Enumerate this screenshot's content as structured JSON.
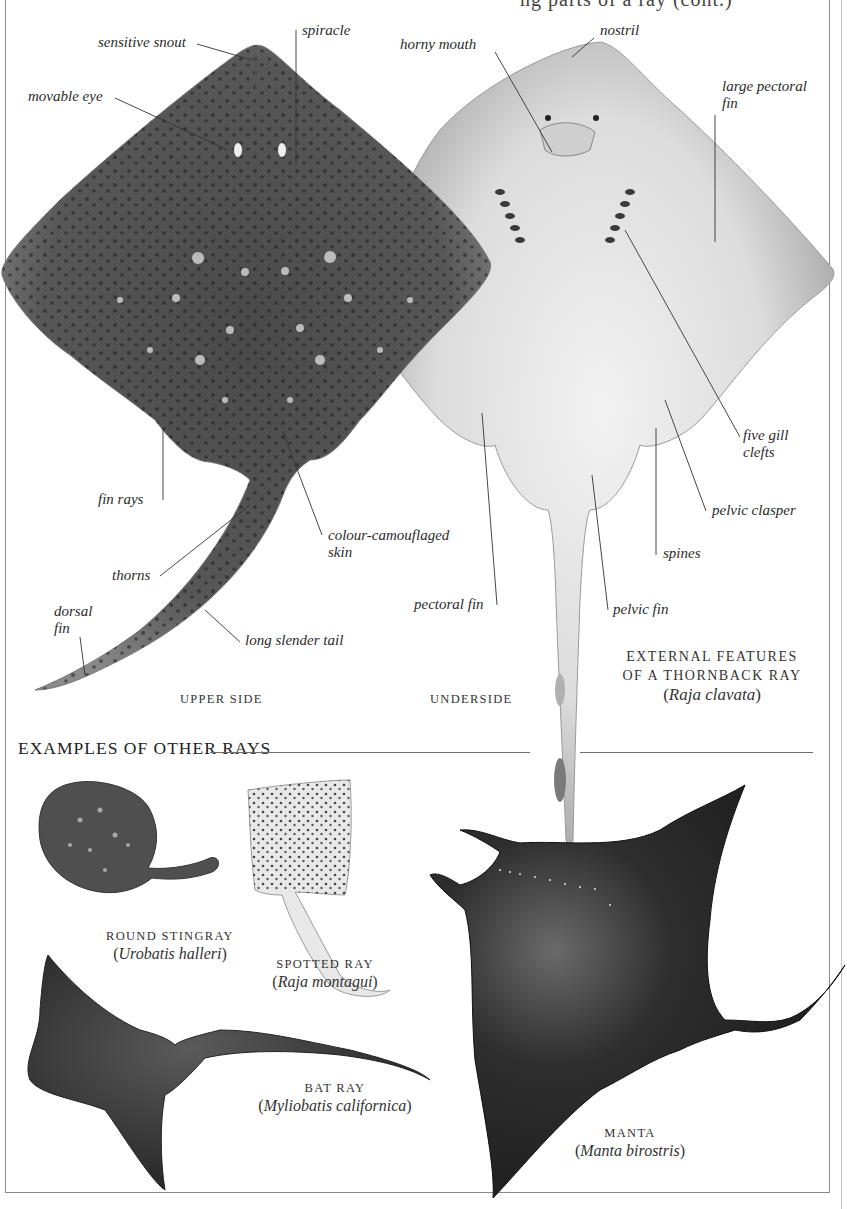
{
  "page": {
    "header_fragment": "ng parts of a ray (cont.)",
    "main_caption": {
      "line1": "EXTERNAL FEATURES",
      "line2": "OF A THORNBACK RAY",
      "sci_name": "Raja clavata"
    },
    "views": {
      "upper": "UPPER SIDE",
      "under": "UNDERSIDE"
    },
    "labels_upper": {
      "sensitive_snout": "sensitive snout",
      "spiracle": "spiracle",
      "movable_eye": "movable eye",
      "fin_rays": "fin rays",
      "colour_skin_1": "colour-camouflaged",
      "colour_skin_2": "skin",
      "thorns": "thorns",
      "dorsal_fin_1": "dorsal",
      "dorsal_fin_2": "fin",
      "long_tail": "long slender tail"
    },
    "labels_under": {
      "horny_mouth": "horny mouth",
      "nostril": "nostril",
      "large_pectoral_1": "large pectoral",
      "large_pectoral_2": "fin",
      "gill_clefts_1": "five gill",
      "gill_clefts_2": "clefts",
      "pelvic_clasper": "pelvic clasper",
      "spines": "spines",
      "pectoral_fin": "pectoral fin",
      "pelvic_fin": "pelvic fin"
    },
    "section": {
      "title": "EXAMPLES OF OTHER RAYS"
    },
    "examples": [
      {
        "common": "ROUND STINGRAY",
        "sci": "Urobatis halleri"
      },
      {
        "common": "SPOTTED RAY",
        "sci": "Raja montagui"
      },
      {
        "common": "BAT RAY",
        "sci": "Myliobatis californica"
      },
      {
        "common": "MANTA",
        "sci": "Manta birostris"
      }
    ],
    "colors": {
      "ink": "#2a2a2a",
      "ray_dark": "#3a3a3a",
      "ray_mid": "#6b6b6b",
      "ray_light": "#d8d8d8",
      "frame": "#8a8a8a"
    }
  }
}
